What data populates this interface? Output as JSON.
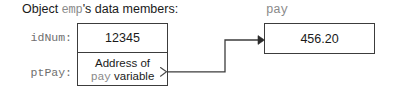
{
  "figure": {
    "caption": {
      "prefix": "Object ",
      "code": "emp",
      "suffix": "'s data members:"
    },
    "object_box": {
      "members": [
        {
          "label": "idNum:",
          "value": "12345",
          "value_style": "plain"
        },
        {
          "label": "ptPay:",
          "value_line1": "Address of",
          "value_line2_code": "pay",
          "value_line2_text": " variable"
        }
      ]
    },
    "pointer_target": {
      "label": "pay",
      "value": "456.20"
    },
    "connector": {
      "from": "ptPay cell right edge",
      "to": "pay box left edge",
      "arrowhead": "filled-triangle",
      "tail_marker": "open-chevron"
    },
    "colors": {
      "border": "#3c3c3c",
      "text": "#1a1a1a",
      "code_text": "#8a8a8a",
      "background": "#ffffff",
      "connector": "#3c3c3c"
    }
  }
}
